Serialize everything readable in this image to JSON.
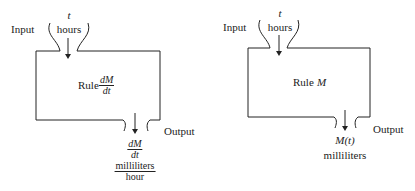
{
  "diagrams": [
    {
      "input_label": "Input",
      "input_var": "t",
      "input_units": "hours",
      "rule_label": "Rule",
      "rule_num": "dM",
      "rule_den": "dt",
      "output_label": "Output",
      "output_num": "dM",
      "output_den": "dt",
      "output_units_num": "milliliters",
      "output_units_den": "hour"
    },
    {
      "input_label": "Input",
      "input_var": "t",
      "input_units": "hours",
      "rule_label": "Rule",
      "rule_symbol": "M",
      "output_label": "Output",
      "output_value": "M(t)",
      "output_units": "milliliters"
    }
  ]
}
